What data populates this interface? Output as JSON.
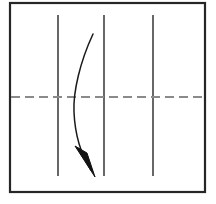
{
  "figure": {
    "title": "",
    "background_color": "#ffffff",
    "width": 216,
    "height": 204
  },
  "frame": {
    "name": "outer-rectangle-border",
    "x": 10,
    "y": 3,
    "width": 195,
    "height": 189,
    "stroke_color": "#262626",
    "stroke_width": 2.2,
    "fill": "none"
  },
  "vertical_lines": {
    "stroke_color": "#4d4d4d",
    "stroke_width": 1.7,
    "y_top": 15,
    "y_bottom": 176,
    "items": [
      {
        "label": "vertical-line-1",
        "x": 58
      },
      {
        "label": "vertical-line-2",
        "x": 104
      },
      {
        "label": "vertical-line-3",
        "x": 153
      }
    ]
  },
  "dashed_centerline": {
    "name": "horizontal-dashed-centerline",
    "x_start": 11,
    "x_end": 204,
    "y": 97,
    "stroke_color": "#8a8a8a",
    "stroke_width": 2.2,
    "dash_length": 9,
    "gap_length": 5
  },
  "curved_arrow": {
    "name": "downward-curved-arrow",
    "stroke_color": "#1a1a1a",
    "stroke_width": 1.5,
    "fill": "none",
    "start_point": {
      "x": 93,
      "y": 34
    },
    "end_point": {
      "x": 94,
      "y": 176
    },
    "control_point_1": {
      "x": 77,
      "y": 70
    },
    "control_point_2": {
      "x": 72,
      "y": 118
    },
    "path": "M 93 34 C 80 62 73 92 74 112 C 75 136 82 156 91 170",
    "arrowhead": {
      "name": "arrowhead-triangle",
      "fill_color": "#121212",
      "tip": {
        "x": 95,
        "y": 177
      },
      "base_left": {
        "x": 75,
        "y": 146
      },
      "base_right": {
        "x": 88,
        "y": 152
      },
      "points": "95,177 75,146 87,153"
    }
  },
  "legend": {
    "visible": false,
    "entries": []
  },
  "annotations": []
}
